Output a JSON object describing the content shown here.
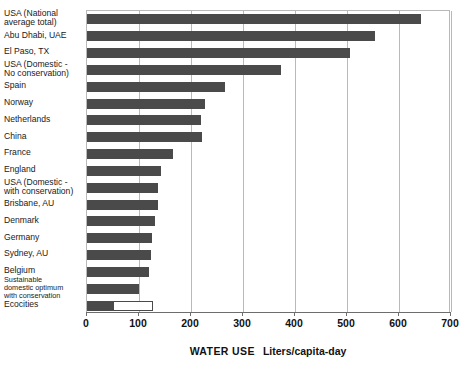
{
  "chart_data": {
    "type": "bar",
    "orientation": "horizontal",
    "title": "",
    "xlabel": "WATER USE   Liters/capita-day",
    "xlabel_main": "WATER USE",
    "xlabel_unit": "Liters/capita-day",
    "ylabel": "",
    "xlim": [
      0,
      700
    ],
    "xticks": [
      0,
      100,
      200,
      300,
      400,
      500,
      600,
      700
    ],
    "xtick_labels": [
      "0",
      "100",
      "200",
      "300",
      "400",
      "500",
      "600",
      "700"
    ],
    "grid": "vertical",
    "legend": "none",
    "bar_color": "#4a4a4a",
    "categories": [
      "USA (National average total)",
      "Abu Dhabi, UAE",
      "El Paso, TX",
      "USA (Domestic - No conservation)",
      "Spain",
      "Norway",
      "Netherlands",
      "China",
      "France",
      "England",
      "USA (Domestic - with conservation)",
      "Brisbane, AU",
      "Denmark",
      "Germany",
      "Sydney, AU",
      "Belgium",
      "Sustainable domestic optimum with conservation",
      "Ecocities"
    ],
    "values": [
      642,
      554,
      506,
      373,
      266,
      227,
      219,
      222,
      165,
      143,
      136,
      136,
      130,
      125,
      124,
      119,
      100,
      127
    ],
    "bars": [
      {
        "label_lines": [
          "USA (National",
          "average total)"
        ],
        "label_size": "normal",
        "value": 642,
        "style": "filled"
      },
      {
        "label_lines": [
          "Abu Dhabi, UAE"
        ],
        "label_size": "normal",
        "value": 554,
        "style": "filled"
      },
      {
        "label_lines": [
          "El Paso, TX"
        ],
        "label_size": "normal",
        "value": 506,
        "style": "filled"
      },
      {
        "label_lines": [
          "USA (Domestic -",
          "No conservation)"
        ],
        "label_size": "normal",
        "value": 373,
        "style": "filled"
      },
      {
        "label_lines": [
          "Spain"
        ],
        "label_size": "normal",
        "value": 266,
        "style": "filled"
      },
      {
        "label_lines": [
          "Norway"
        ],
        "label_size": "normal",
        "value": 227,
        "style": "filled"
      },
      {
        "label_lines": [
          "Netherlands"
        ],
        "label_size": "normal",
        "value": 219,
        "style": "filled"
      },
      {
        "label_lines": [
          "China"
        ],
        "label_size": "normal",
        "value": 222,
        "style": "filled"
      },
      {
        "label_lines": [
          "France"
        ],
        "label_size": "normal",
        "value": 165,
        "style": "filled"
      },
      {
        "label_lines": [
          "England"
        ],
        "label_size": "normal",
        "value": 143,
        "style": "filled"
      },
      {
        "label_lines": [
          "USA (Domestic -",
          "with conservation)"
        ],
        "label_size": "normal",
        "value": 136,
        "style": "filled"
      },
      {
        "label_lines": [
          "Brisbane, AU"
        ],
        "label_size": "normal",
        "value": 136,
        "style": "filled"
      },
      {
        "label_lines": [
          "Denmark"
        ],
        "label_size": "normal",
        "value": 130,
        "style": "filled"
      },
      {
        "label_lines": [
          "Germany"
        ],
        "label_size": "normal",
        "value": 125,
        "style": "filled"
      },
      {
        "label_lines": [
          "Sydney, AU"
        ],
        "label_size": "normal",
        "value": 124,
        "style": "filled"
      },
      {
        "label_lines": [
          "Belgium"
        ],
        "label_size": "normal",
        "value": 119,
        "style": "filled"
      },
      {
        "label_lines": [
          "Sustainable",
          "domestic optimum",
          "with conservation"
        ],
        "label_size": "small",
        "value": 100,
        "style": "filled"
      },
      {
        "label_lines": [
          "Ecocities"
        ],
        "label_size": "normal",
        "value": 127,
        "style": "split",
        "filled_value": 51,
        "outline_value": 127
      }
    ]
  }
}
